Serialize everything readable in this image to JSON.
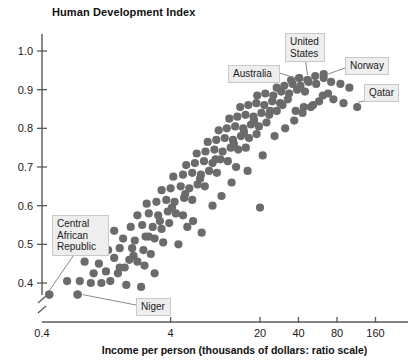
{
  "chart_data": {
    "type": "scatter",
    "title": "Human Development Index",
    "ylabel": "Human Development Index",
    "xlabel": "Income per person (thousands of dollars: ratio scale)",
    "x_scale": "log",
    "x_tick_labels": [
      "0.4",
      "4",
      "20",
      "40",
      "80",
      "160"
    ],
    "x_tick_values": [
      0.4,
      4,
      20,
      40,
      80,
      160
    ],
    "y_tick_labels": [
      "0.4",
      "0.5",
      "0.6",
      "0.7",
      "0.8",
      "0.9",
      "1.0"
    ],
    "y_tick_values": [
      0.4,
      0.5,
      0.6,
      0.7,
      0.8,
      0.9,
      1.0
    ],
    "ylim": [
      0.34,
      1.03
    ],
    "xlim": [
      0.4,
      200
    ],
    "grid": false,
    "legend": false,
    "axis_break": true,
    "marker_color": "#6b6b6b",
    "marker_radius": 4.1,
    "points": [
      [
        0.45,
        0.37
      ],
      [
        0.75,
        0.37
      ],
      [
        0.62,
        0.405
      ],
      [
        0.78,
        0.405
      ],
      [
        0.95,
        0.4
      ],
      [
        1.15,
        0.4
      ],
      [
        1.35,
        0.405
      ],
      [
        1.0,
        0.425
      ],
      [
        1.25,
        0.43
      ],
      [
        1.55,
        0.425
      ],
      [
        1.75,
        0.44
      ],
      [
        0.85,
        0.455
      ],
      [
        1.1,
        0.45
      ],
      [
        1.45,
        0.465
      ],
      [
        1.9,
        0.46
      ],
      [
        2.2,
        0.455
      ],
      [
        1.3,
        0.485
      ],
      [
        1.6,
        0.49
      ],
      [
        2.0,
        0.49
      ],
      [
        2.45,
        0.485
      ],
      [
        2.8,
        0.475
      ],
      [
        1.15,
        0.505
      ],
      [
        1.7,
        0.515
      ],
      [
        2.1,
        0.51
      ],
      [
        2.55,
        0.52
      ],
      [
        3.0,
        0.515
      ],
      [
        3.5,
        0.505
      ],
      [
        1.45,
        0.535
      ],
      [
        1.95,
        0.545
      ],
      [
        2.4,
        0.55
      ],
      [
        2.9,
        0.545
      ],
      [
        3.4,
        0.54
      ],
      [
        3.9,
        0.555
      ],
      [
        2.2,
        0.575
      ],
      [
        2.7,
        0.58
      ],
      [
        3.2,
        0.575
      ],
      [
        3.8,
        0.585
      ],
      [
        4.4,
        0.58
      ],
      [
        5.0,
        0.575
      ],
      [
        2.6,
        0.605
      ],
      [
        3.1,
        0.61
      ],
      [
        3.7,
        0.615
      ],
      [
        4.3,
        0.61
      ],
      [
        5.1,
        0.62
      ],
      [
        5.9,
        0.615
      ],
      [
        3.4,
        0.64
      ],
      [
        4.0,
        0.645
      ],
      [
        4.8,
        0.65
      ],
      [
        5.6,
        0.645
      ],
      [
        6.5,
        0.655
      ],
      [
        7.4,
        0.65
      ],
      [
        4.2,
        0.675
      ],
      [
        5.0,
        0.68
      ],
      [
        5.9,
        0.685
      ],
      [
        6.9,
        0.68
      ],
      [
        8.0,
        0.69
      ],
      [
        9.2,
        0.685
      ],
      [
        5.3,
        0.705
      ],
      [
        6.2,
        0.71
      ],
      [
        7.3,
        0.715
      ],
      [
        8.5,
        0.71
      ],
      [
        9.8,
        0.72
      ],
      [
        11.2,
        0.715
      ],
      [
        6.4,
        0.735
      ],
      [
        7.5,
        0.74
      ],
      [
        8.8,
        0.745
      ],
      [
        10.2,
        0.74
      ],
      [
        11.8,
        0.75
      ],
      [
        13.5,
        0.745
      ],
      [
        15.5,
        0.75
      ],
      [
        7.8,
        0.765
      ],
      [
        9.1,
        0.77
      ],
      [
        10.6,
        0.775
      ],
      [
        12.3,
        0.77
      ],
      [
        14.2,
        0.78
      ],
      [
        16.4,
        0.775
      ],
      [
        18.8,
        0.785
      ],
      [
        9.5,
        0.795
      ],
      [
        11.0,
        0.8
      ],
      [
        12.8,
        0.805
      ],
      [
        14.8,
        0.8
      ],
      [
        17.0,
        0.81
      ],
      [
        19.6,
        0.805
      ],
      [
        22.5,
        0.815
      ],
      [
        11.5,
        0.825
      ],
      [
        13.3,
        0.83
      ],
      [
        15.4,
        0.835
      ],
      [
        17.8,
        0.83
      ],
      [
        20.5,
        0.84
      ],
      [
        23.6,
        0.835
      ],
      [
        27.0,
        0.845
      ],
      [
        14.0,
        0.855
      ],
      [
        16.2,
        0.86
      ],
      [
        18.7,
        0.865
      ],
      [
        21.6,
        0.86
      ],
      [
        24.9,
        0.87
      ],
      [
        28.7,
        0.865
      ],
      [
        33.0,
        0.875
      ],
      [
        19.0,
        0.885
      ],
      [
        22.0,
        0.89
      ],
      [
        25.4,
        0.885
      ],
      [
        29.3,
        0.895
      ],
      [
        33.8,
        0.89
      ],
      [
        39.0,
        0.9
      ],
      [
        45.0,
        0.895
      ],
      [
        27.0,
        0.905
      ],
      [
        31.0,
        0.91
      ],
      [
        36.0,
        0.915
      ],
      [
        41.5,
        0.91
      ],
      [
        48.0,
        0.92
      ],
      [
        55.0,
        0.915
      ],
      [
        35.0,
        0.925
      ],
      [
        40.5,
        0.93
      ],
      [
        47.0,
        0.925
      ],
      [
        54.0,
        0.935
      ],
      [
        63.0,
        0.93
      ],
      [
        72.0,
        0.92
      ],
      [
        85.0,
        0.915
      ],
      [
        100.0,
        0.905
      ],
      [
        62.0,
        0.885
      ],
      [
        75.0,
        0.875
      ],
      [
        90.0,
        0.865
      ],
      [
        52.0,
        0.86
      ],
      [
        44.0,
        0.855
      ],
      [
        38.0,
        0.845
      ],
      [
        20.0,
        0.595
      ],
      [
        2.5,
        0.445
      ],
      [
        3.0,
        0.425
      ],
      [
        1.8,
        0.395
      ],
      [
        2.35,
        0.39
      ],
      [
        6.0,
        0.56
      ],
      [
        7.0,
        0.53
      ],
      [
        8.5,
        0.6
      ],
      [
        4.6,
        0.5
      ],
      [
        5.4,
        0.545
      ],
      [
        10.0,
        0.625
      ],
      [
        12.0,
        0.66
      ],
      [
        13.0,
        0.7
      ],
      [
        16.0,
        0.69
      ],
      [
        21.0,
        0.73
      ],
      [
        26.0,
        0.78
      ],
      [
        31.5,
        0.8
      ],
      [
        37.0,
        0.82
      ],
      [
        43.0,
        0.84
      ],
      [
        50.0,
        0.855
      ],
      [
        58.0,
        0.87
      ],
      [
        68.0,
        0.89
      ],
      [
        30.0,
        0.86
      ],
      [
        24.0,
        0.845
      ],
      [
        18.0,
        0.82
      ],
      [
        15.0,
        0.79
      ],
      [
        12.5,
        0.76
      ],
      [
        9.0,
        0.72
      ],
      [
        6.8,
        0.67
      ],
      [
        5.2,
        0.63
      ],
      [
        4.1,
        0.595
      ],
      [
        3.3,
        0.56
      ],
      [
        2.7,
        0.52
      ],
      [
        2.05,
        0.47
      ],
      [
        1.6,
        0.44
      ]
    ],
    "annotated_points": [
      {
        "label": "Central African Republic",
        "x": 0.45,
        "y": 0.37
      },
      {
        "label": "Niger",
        "x": 0.75,
        "y": 0.37
      },
      {
        "label": "Australia",
        "x": 40.5,
        "y": 0.93
      },
      {
        "label": "United States",
        "x": 47.0,
        "y": 0.925
      },
      {
        "label": "Norway",
        "x": 63.0,
        "y": 0.94
      },
      {
        "label": "Qatar",
        "x": 115.0,
        "y": 0.855
      }
    ]
  },
  "callouts": {
    "central_african_republic": "Central\nAfrican\nRepublic",
    "niger": "Niger",
    "australia": "Australia",
    "united_states": "United\nStates",
    "norway": "Norway",
    "qatar": "Qatar"
  },
  "colors": {
    "marker": "#6b6b6b",
    "axis": "#5a5a5a",
    "callout_bg": "#eeeeee",
    "callout_border": "#c9c9c9",
    "text": "#1a1a1a"
  }
}
